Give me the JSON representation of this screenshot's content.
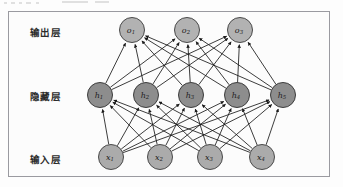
{
  "diagram": {
    "title": "",
    "type": "neural-network",
    "background_color": "#fcfcfc",
    "frame_color": "#9a9aa0",
    "edge_color": "#1a1a1a",
    "layers": [
      {
        "id": "output",
        "label": "输出层",
        "label_x": 30,
        "label_y": 31,
        "y": 30,
        "radius": 12.5,
        "fill": "#b2b2b2",
        "stroke": "#4a4a4a",
        "nodes": [
          {
            "base": "o",
            "sub": "1",
            "x": 132
          },
          {
            "base": "o",
            "sub": "2",
            "x": 187
          },
          {
            "base": "o",
            "sub": "3",
            "x": 240
          }
        ]
      },
      {
        "id": "hidden",
        "label": "隐藏层",
        "label_x": 30,
        "label_y": 95,
        "y": 95,
        "radius": 12.5,
        "fill": "#8d8d8d",
        "stroke": "#3c3c3c",
        "nodes": [
          {
            "base": "h",
            "sub": "1",
            "x": 100
          },
          {
            "base": "h",
            "sub": "2",
            "x": 146
          },
          {
            "base": "h",
            "sub": "3",
            "x": 191
          },
          {
            "base": "h",
            "sub": "4",
            "x": 237
          },
          {
            "base": "h",
            "sub": "5",
            "x": 283
          }
        ]
      },
      {
        "id": "input",
        "label": "输入层",
        "label_x": 30,
        "label_y": 158,
        "y": 157,
        "radius": 12.5,
        "fill": "#ababab",
        "stroke": "#4a4a4a",
        "nodes": [
          {
            "base": "x",
            "sub": "1",
            "x": 111
          },
          {
            "base": "x",
            "sub": "2",
            "x": 160
          },
          {
            "base": "x",
            "sub": "3",
            "x": 210
          },
          {
            "base": "x",
            "sub": "4",
            "x": 262
          }
        ]
      }
    ],
    "connections": [
      {
        "from_layer": "input",
        "to_layer": "hidden",
        "fully_connected": true,
        "directed": true
      },
      {
        "from_layer": "hidden",
        "to_layer": "output",
        "fully_connected": true,
        "directed": true
      }
    ]
  }
}
